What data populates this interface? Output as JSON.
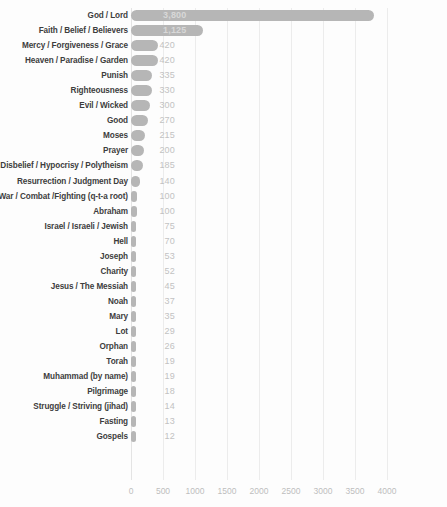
{
  "chart_data": {
    "type": "bar",
    "orientation": "horizontal",
    "title": "",
    "subtitle": "",
    "xlabel": "",
    "ylabel": "",
    "xlim": [
      0,
      4000
    ],
    "grid": true,
    "legend": null,
    "bar_color": "#b6b6b6",
    "gridline_color": "#ececec",
    "value_label_color": "#c2c2c2",
    "category_label_color": "#3d3d3d",
    "xticks": [
      0,
      500,
      1000,
      1500,
      2000,
      2500,
      3000,
      3500,
      4000
    ],
    "xtick_labels": [
      "0",
      "500",
      "1000",
      "1500",
      "2000",
      "2500",
      "3000",
      "3500",
      "4000"
    ],
    "categories": [
      "God / Lord",
      "Faith / Belief / Believers",
      "Mercy / Forgiveness / Grace",
      "Heaven / Paradise / Garden",
      "Punish",
      "Righteousness",
      "Evil / Wicked",
      "Good",
      "Moses",
      "Prayer",
      "Disbelief / Hypocrisy / Polytheism",
      "Resurrection / Judgment Day",
      "War / Combat /Fighting (q-t-a root)",
      "Abraham",
      "Israel / Israeli / Jewish",
      "Hell",
      "Joseph",
      "Charity",
      "Jesus / The Messiah",
      "Noah",
      "Mary",
      "Lot",
      "Orphan",
      "Torah",
      "Muhammad (by name)",
      "Pilgrimage",
      "Struggle / Striving (jihad)",
      "Fasting",
      "Gospels"
    ],
    "values": [
      3800,
      1125,
      420,
      420,
      335,
      330,
      300,
      270,
      215,
      200,
      185,
      140,
      100,
      100,
      75,
      70,
      53,
      52,
      45,
      37,
      35,
      29,
      26,
      19,
      19,
      18,
      14,
      13,
      12
    ],
    "value_labels": [
      "3,800",
      "1,125",
      "420",
      "420",
      "335",
      "330",
      "300",
      "270",
      "215",
      "200",
      "185",
      "140",
      "100",
      "100",
      "75",
      "70",
      "53",
      "52",
      "45",
      "37",
      "35",
      "29",
      "26",
      "19",
      "19",
      "18",
      "14",
      "13",
      "12"
    ]
  }
}
